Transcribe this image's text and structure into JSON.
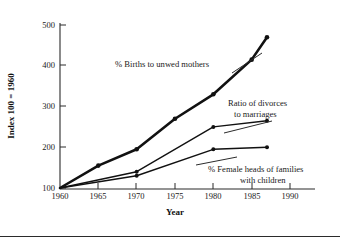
{
  "chart_data": {
    "type": "line",
    "title": "",
    "xlabel": "Year",
    "ylabel": "Index 100 = 1960",
    "xlim": [
      1960,
      1990
    ],
    "ylim": [
      100,
      500
    ],
    "xticks": [
      "1960",
      "1965",
      "1970",
      "1975",
      "1980",
      "1985",
      "1990"
    ],
    "yticks": [
      "100",
      "200",
      "300",
      "400",
      "500"
    ],
    "grid": false,
    "legend_position": "inline-annotations",
    "series": [
      {
        "name": "% Births to unwed mothers",
        "x": [
          1960,
          1965,
          1970,
          1975,
          1980,
          1985,
          1987
        ],
        "values": [
          100,
          155,
          195,
          270,
          330,
          415,
          470
        ],
        "line_width": 2.6
      },
      {
        "name": "Ratio of divorces to marriages",
        "x": [
          1960,
          1970,
          1980,
          1987
        ],
        "values": [
          100,
          140,
          250,
          265
        ],
        "line_width": 1.4
      },
      {
        "name": "% Female heads of families with children",
        "x": [
          1960,
          1970,
          1980,
          1987
        ],
        "values": [
          100,
          130,
          195,
          200
        ],
        "line_width": 1.4
      }
    ],
    "annotations": [
      {
        "text": "% Births to unwed mothers",
        "x": 1975,
        "y": 415
      },
      {
        "text_line1": "Ratio of divorces",
        "text_line2": "to marriages",
        "x": 1982,
        "y": 318
      },
      {
        "text_line1": "% Female heads of families",
        "text_line2": "with children",
        "x": 1982,
        "y": 178
      }
    ]
  },
  "axes": {
    "y_title": "Index 100 = 1960",
    "x_title": "Year",
    "y_tick_labels": [
      "500",
      "400",
      "300",
      "200",
      "100"
    ],
    "x_tick_labels": [
      "1960",
      "1965",
      "1970",
      "1975",
      "1980",
      "1985",
      "1990"
    ]
  },
  "annotations": {
    "unwed": "% Births to unwed mothers",
    "divorce_l1": "Ratio of divorces",
    "divorce_l2": "to marriages",
    "female_l1": "% Female heads of families",
    "female_l2": "with children"
  }
}
